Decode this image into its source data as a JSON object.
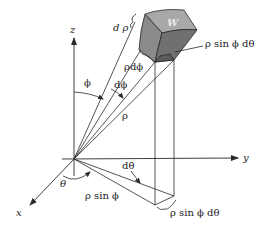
{
  "figure": {
    "colors": {
      "line": "#2a2a2a",
      "wedge_top": "#a8a8a8",
      "wedge_front": "#8a8a8a",
      "wedge_side": "#707070",
      "wedge_under": "#5c5c5c",
      "background": "#ffffff"
    },
    "axes": {
      "x_label": "x",
      "y_label": "y",
      "z_label": "z"
    },
    "labels": {
      "d_rho": "d ρ",
      "region": "W",
      "rho_sin_phi_d_theta_top": "ρ sin ϕ dθ",
      "rho_d_phi": "ρdϕ",
      "phi": "ϕ",
      "d_phi": "dϕ",
      "rho": "ρ",
      "d_theta": "dθ",
      "theta": "θ",
      "rho_sin_phi": "ρ sin ϕ",
      "rho_sin_phi_d_theta_bottom": "ρ sin ϕ dθ"
    }
  }
}
